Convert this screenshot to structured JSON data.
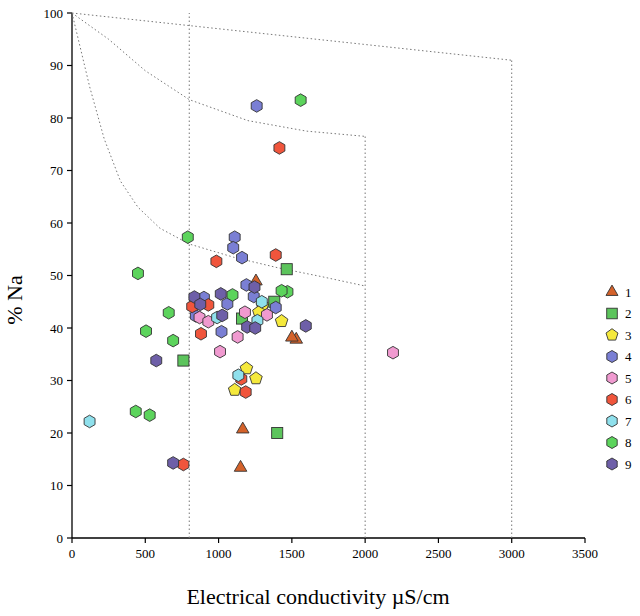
{
  "chart_data": {
    "type": "scatter",
    "title": "",
    "xlabel": "Electrical conductivity µS/cm",
    "ylabel": "% Na",
    "xlim": [
      0,
      3500
    ],
    "ylim": [
      0,
      100
    ],
    "xticks": [
      0,
      500,
      1000,
      1500,
      2000,
      2500,
      3000,
      3500
    ],
    "yticks": [
      0,
      10,
      20,
      30,
      40,
      50,
      60,
      70,
      80,
      90,
      100
    ],
    "grid": false,
    "legend_position": "right",
    "legend_title": "",
    "series": [
      {
        "name": "1",
        "marker": "triangle",
        "color": "#d4622a",
        "points": [
          [
            1165,
            20.7
          ],
          [
            1150,
            13.4
          ],
          [
            1255,
            48.9
          ],
          [
            1530,
            37.8
          ],
          [
            1500,
            38.2
          ]
        ]
      },
      {
        "name": "2",
        "marker": "square",
        "color": "#5cc45c",
        "points": [
          [
            760,
            33.8
          ],
          [
            1400,
            20.0
          ],
          [
            1465,
            51.2
          ],
          [
            1380,
            45.0
          ],
          [
            1160,
            41.8
          ]
        ]
      },
      {
        "name": "3",
        "marker": "pentagon",
        "color": "#f5e93c",
        "points": [
          [
            1190,
            32.3
          ],
          [
            1255,
            30.4
          ],
          [
            1110,
            28.2
          ],
          [
            1300,
            44.3
          ],
          [
            1275,
            43.0
          ],
          [
            1430,
            41.3
          ]
        ]
      },
      {
        "name": "4",
        "marker": "hexagon",
        "color": "#7a7fd4",
        "points": [
          [
            1110,
            57.3
          ],
          [
            1100,
            55.3
          ],
          [
            1160,
            53.4
          ],
          [
            1190,
            48.2
          ],
          [
            1060,
            44.6
          ],
          [
            1240,
            46.0
          ],
          [
            900,
            45.8
          ],
          [
            1260,
            82.3
          ],
          [
            1020,
            39.3
          ],
          [
            1390,
            43.9
          ],
          [
            845,
            42.3
          ]
        ]
      },
      {
        "name": "5",
        "marker": "hexagon",
        "color": "#f09ad0",
        "points": [
          [
            2190,
            35.3
          ],
          [
            1010,
            35.5
          ],
          [
            1130,
            38.3
          ],
          [
            870,
            42.0
          ],
          [
            930,
            41.2
          ],
          [
            1180,
            43.0
          ],
          [
            1330,
            42.5
          ]
        ]
      },
      {
        "name": "6",
        "marker": "hexagon",
        "color": "#f0553c",
        "points": [
          [
            1415,
            74.3
          ],
          [
            1390,
            53.9
          ],
          [
            985,
            52.7
          ],
          [
            760,
            14.0
          ],
          [
            880,
            38.9
          ],
          [
            820,
            44.1
          ],
          [
            1185,
            27.8
          ],
          [
            1155,
            30.3
          ],
          [
            930,
            44.4
          ]
        ]
      },
      {
        "name": "7",
        "marker": "hexagon",
        "color": "#8fe0ec",
        "points": [
          [
            120,
            22.2
          ],
          [
            1135,
            31.0
          ],
          [
            1265,
            41.4
          ],
          [
            990,
            42.0
          ],
          [
            1295,
            45.0
          ]
        ]
      },
      {
        "name": "8",
        "marker": "hexagon",
        "color": "#5cd45c",
        "points": [
          [
            1560,
            83.4
          ],
          [
            790,
            57.3
          ],
          [
            450,
            50.4
          ],
          [
            505,
            39.4
          ],
          [
            530,
            23.4
          ],
          [
            435,
            24.1
          ],
          [
            690,
            37.6
          ],
          [
            660,
            42.9
          ],
          [
            1470,
            46.9
          ],
          [
            1430,
            47.1
          ],
          [
            1095,
            46.3
          ]
        ]
      },
      {
        "name": "9",
        "marker": "hexagon",
        "color": "#6e5fa8",
        "points": [
          [
            575,
            33.8
          ],
          [
            690,
            14.3
          ],
          [
            835,
            45.9
          ],
          [
            875,
            44.5
          ],
          [
            1025,
            42.4
          ],
          [
            1195,
            40.2
          ],
          [
            1250,
            40.0
          ],
          [
            1595,
            40.4
          ],
          [
            1245,
            47.8
          ],
          [
            1015,
            46.5
          ]
        ]
      }
    ],
    "boundary_lines": {
      "vertical_lines_x": [
        800,
        2000,
        3000
      ],
      "description": "Wilcox-style classification boundary curves"
    }
  }
}
